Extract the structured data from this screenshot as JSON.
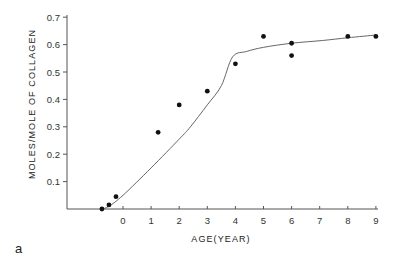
{
  "panel_label": "a",
  "chart_data": {
    "type": "scatter",
    "title": "",
    "xlabel": "AGE(YEAR)",
    "ylabel": "MOLES/MOLE OF COLLAGEN",
    "xlim": [
      -2,
      9
    ],
    "ylim": [
      0,
      0.7
    ],
    "x_ticks": [
      0,
      1,
      2,
      3,
      4,
      5,
      6,
      7,
      8,
      9
    ],
    "x_tick_labels": [
      "0",
      "1",
      "2",
      "3",
      "4",
      "5",
      "6",
      "7",
      "8",
      "9"
    ],
    "y_ticks": [
      0.1,
      0.2,
      0.3,
      0.4,
      0.5,
      0.6,
      0.7
    ],
    "y_tick_labels": [
      "0.1",
      "0.2",
      "0.3",
      "0.4",
      "0.5",
      "0.6",
      "0.7"
    ],
    "grid": false,
    "legend": null,
    "series": [
      {
        "name": "observed",
        "kind": "points",
        "x": [
          -0.75,
          -0.5,
          -0.25,
          1.25,
          2.0,
          3.0,
          4.0,
          5.0,
          6.0,
          6.0,
          8.0,
          9.0
        ],
        "y": [
          0.0,
          0.015,
          0.045,
          0.28,
          0.38,
          0.43,
          0.53,
          0.63,
          0.605,
          0.56,
          0.63,
          0.63
        ]
      },
      {
        "name": "fitted curve",
        "kind": "line",
        "x": [
          -0.75,
          -0.5,
          0.0,
          1.0,
          2.0,
          2.4,
          3.0,
          3.5,
          3.9,
          4.4,
          5.0,
          6.0,
          7.1,
          8.0,
          9.0
        ],
        "y": [
          0.0,
          0.01,
          0.05,
          0.15,
          0.255,
          0.3,
          0.38,
          0.45,
          0.555,
          0.575,
          0.59,
          0.605,
          0.615,
          0.625,
          0.635
        ]
      }
    ]
  }
}
